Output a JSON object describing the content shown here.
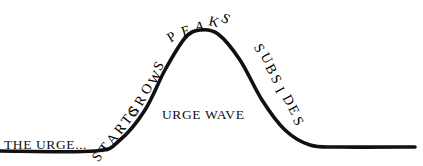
{
  "figure": {
    "title_label": "URGE WAVE",
    "background_color": "#ffffff",
    "stroke_color": "#111111",
    "stroke_width": 3.6
  },
  "labels": {
    "the_urge": "THE URGE...",
    "urge_wave": "URGE WAVE",
    "starts": "STARTS",
    "grows": "GROWS",
    "peaks": "PEAKS",
    "subsides": "SUBSIDES"
  },
  "chart_data": {
    "type": "line",
    "title": "URGE WAVE",
    "xlabel": "",
    "ylabel": "",
    "grid": false,
    "legend": "none",
    "annotations": [
      {
        "text": "THE URGE...",
        "position": "baseline-left",
        "rotation": 0
      },
      {
        "text": "STARTS",
        "position": "rising-lower",
        "rotation": -52
      },
      {
        "text": "GROWS",
        "position": "rising-upper",
        "rotation": -62
      },
      {
        "text": "PEAKS",
        "position": "apex",
        "rotation": 0
      },
      {
        "text": "SUBSIDES",
        "position": "falling",
        "rotation": 62
      },
      {
        "text": "URGE WAVE",
        "position": "center-under-curve",
        "rotation": 0
      }
    ],
    "curve_points": [
      {
        "x": 0,
        "y": 151
      },
      {
        "x": 95,
        "y": 151
      },
      {
        "x": 120,
        "y": 140
      },
      {
        "x": 145,
        "y": 110
      },
      {
        "x": 165,
        "y": 70
      },
      {
        "x": 185,
        "y": 38
      },
      {
        "x": 200,
        "y": 30
      },
      {
        "x": 218,
        "y": 34
      },
      {
        "x": 240,
        "y": 60
      },
      {
        "x": 262,
        "y": 100
      },
      {
        "x": 285,
        "y": 130
      },
      {
        "x": 310,
        "y": 145
      },
      {
        "x": 340,
        "y": 147
      },
      {
        "x": 415,
        "y": 147
      }
    ],
    "axis_ranges": {
      "xlim": [
        0,
        423
      ],
      "ylim": [
        0,
        166
      ]
    }
  },
  "arcs": {
    "starts": {
      "letters": [
        "S",
        "T",
        "A",
        "R",
        "T",
        "S"
      ],
      "origin_x": 100,
      "origin_y": 146,
      "step_x": 7.2,
      "step_y": -9.2,
      "rotation": -52,
      "font_size": 14
    },
    "grows": {
      "letters": [
        "G",
        "R",
        "O",
        "W",
        "S"
      ],
      "origin_x": 136,
      "origin_y": 100,
      "step_x": 6.6,
      "step_y": -11.4,
      "rotation": -60,
      "font_size": 14
    },
    "peaks": {
      "letters": [
        "P",
        "E",
        "A",
        "K",
        "S"
      ],
      "origin_x": 172,
      "origin_y": 28,
      "step_x": 11.6,
      "step_y": -4.6,
      "rotation": -32,
      "rotation_step": 15,
      "font_size": 14
    },
    "subsides": {
      "letters": [
        "S",
        "U",
        "B",
        "S",
        "I",
        "D",
        "E",
        "S"
      ],
      "origin_x": 248,
      "origin_y": 36,
      "step_x": 5.6,
      "step_y": 10.4,
      "rotation": 62,
      "font_size": 14
    }
  }
}
